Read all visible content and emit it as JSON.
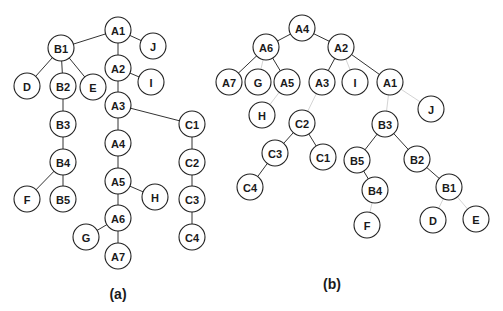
{
  "figure": {
    "panels": [
      {
        "id": "a",
        "caption": "(a)",
        "caption_pos": [
          118,
          286
        ],
        "nodes": [
          {
            "label": "A1",
            "x": 118,
            "y": 30
          },
          {
            "label": "J",
            "x": 153,
            "y": 46
          },
          {
            "label": "B1",
            "x": 61,
            "y": 48
          },
          {
            "label": "A2",
            "x": 118,
            "y": 68
          },
          {
            "label": "I",
            "x": 151,
            "y": 82
          },
          {
            "label": "D",
            "x": 27,
            "y": 86
          },
          {
            "label": "B2",
            "x": 63,
            "y": 86
          },
          {
            "label": "E",
            "x": 93,
            "y": 87
          },
          {
            "label": "A3",
            "x": 118,
            "y": 105
          },
          {
            "label": "C1",
            "x": 192,
            "y": 124
          },
          {
            "label": "B3",
            "x": 63,
            "y": 124
          },
          {
            "label": "A4",
            "x": 118,
            "y": 143
          },
          {
            "label": "C2",
            "x": 192,
            "y": 162
          },
          {
            "label": "B4",
            "x": 63,
            "y": 162
          },
          {
            "label": "A5",
            "x": 118,
            "y": 181
          },
          {
            "label": "H",
            "x": 155,
            "y": 197
          },
          {
            "label": "C3",
            "x": 192,
            "y": 199
          },
          {
            "label": "F",
            "x": 27,
            "y": 199
          },
          {
            "label": "B5",
            "x": 63,
            "y": 199
          },
          {
            "label": "A6",
            "x": 118,
            "y": 218
          },
          {
            "label": "C4",
            "x": 192,
            "y": 237
          },
          {
            "label": "G",
            "x": 86,
            "y": 237
          },
          {
            "label": "A7",
            "x": 118,
            "y": 256
          }
        ],
        "edges": [
          [
            "A1",
            "B1",
            "dark"
          ],
          [
            "A1",
            "J",
            "dark"
          ],
          [
            "A1",
            "A2",
            "dark"
          ],
          [
            "B1",
            "D",
            "dark"
          ],
          [
            "B1",
            "B2",
            "dark"
          ],
          [
            "B1",
            "E",
            "dark"
          ],
          [
            "A2",
            "I",
            "dark"
          ],
          [
            "A2",
            "A3",
            "dark"
          ],
          [
            "A3",
            "A4",
            "dark"
          ],
          [
            "A3",
            "C1",
            "dark"
          ],
          [
            "B2",
            "B3",
            "dark"
          ],
          [
            "B3",
            "B4",
            "dark"
          ],
          [
            "B4",
            "F",
            "dark"
          ],
          [
            "B4",
            "B5",
            "dark"
          ],
          [
            "A4",
            "A5",
            "dark"
          ],
          [
            "A5",
            "H",
            "dark"
          ],
          [
            "A5",
            "A6",
            "dark"
          ],
          [
            "A6",
            "G",
            "dark"
          ],
          [
            "A6",
            "A7",
            "dark"
          ],
          [
            "C1",
            "C2",
            "dark"
          ],
          [
            "C2",
            "C3",
            "dark"
          ],
          [
            "C3",
            "C4",
            "dark"
          ]
        ]
      },
      {
        "id": "b",
        "caption": "(b)",
        "caption_pos": [
          332,
          276
        ],
        "nodes": [
          {
            "label": "A4",
            "x": 302,
            "y": 28
          },
          {
            "label": "A6",
            "x": 266,
            "y": 47
          },
          {
            "label": "A2",
            "x": 341,
            "y": 47
          },
          {
            "label": "A7",
            "x": 229,
            "y": 82
          },
          {
            "label": "G",
            "x": 258,
            "y": 82
          },
          {
            "label": "A5",
            "x": 287,
            "y": 82
          },
          {
            "label": "A3",
            "x": 322,
            "y": 82
          },
          {
            "label": "I",
            "x": 355,
            "y": 82
          },
          {
            "label": "A1",
            "x": 390,
            "y": 82
          },
          {
            "label": "H",
            "x": 262,
            "y": 115
          },
          {
            "label": "J",
            "x": 431,
            "y": 109
          },
          {
            "label": "C2",
            "x": 302,
            "y": 123
          },
          {
            "label": "B3",
            "x": 385,
            "y": 124
          },
          {
            "label": "C3",
            "x": 275,
            "y": 153
          },
          {
            "label": "C1",
            "x": 323,
            "y": 157
          },
          {
            "label": "B5",
            "x": 357,
            "y": 160
          },
          {
            "label": "B2",
            "x": 417,
            "y": 159
          },
          {
            "label": "C4",
            "x": 250,
            "y": 187
          },
          {
            "label": "B4",
            "x": 375,
            "y": 190
          },
          {
            "label": "B1",
            "x": 449,
            "y": 187
          },
          {
            "label": "F",
            "x": 367,
            "y": 225
          },
          {
            "label": "D",
            "x": 433,
            "y": 220
          },
          {
            "label": "E",
            "x": 476,
            "y": 219
          }
        ],
        "edges": [
          [
            "A4",
            "A6",
            "dark"
          ],
          [
            "A4",
            "A2",
            "dark"
          ],
          [
            "A6",
            "A7",
            "dark"
          ],
          [
            "A6",
            "G",
            "light"
          ],
          [
            "A6",
            "A5",
            "dark"
          ],
          [
            "A2",
            "A3",
            "dark"
          ],
          [
            "A2",
            "I",
            "light"
          ],
          [
            "A2",
            "A1",
            "dark"
          ],
          [
            "A5",
            "H",
            "light"
          ],
          [
            "A3",
            "C2",
            "light"
          ],
          [
            "A1",
            "J",
            "light"
          ],
          [
            "A1",
            "B3",
            "light"
          ],
          [
            "C2",
            "C3",
            "dark"
          ],
          [
            "C2",
            "C1",
            "dark"
          ],
          [
            "C3",
            "C4",
            "dark"
          ],
          [
            "B3",
            "B5",
            "dark"
          ],
          [
            "B3",
            "B2",
            "dark"
          ],
          [
            "B5",
            "B4",
            "dark"
          ],
          [
            "B4",
            "F",
            "light"
          ],
          [
            "B2",
            "B1",
            "dark"
          ],
          [
            "B1",
            "D",
            "light"
          ],
          [
            "B1",
            "E",
            "light"
          ]
        ]
      }
    ],
    "node_radius": 13,
    "colors": {
      "node_stroke": "#222222",
      "edge_dark": "#333333",
      "edge_light": "#d4d4d4",
      "text": "#1a1a1a"
    }
  }
}
